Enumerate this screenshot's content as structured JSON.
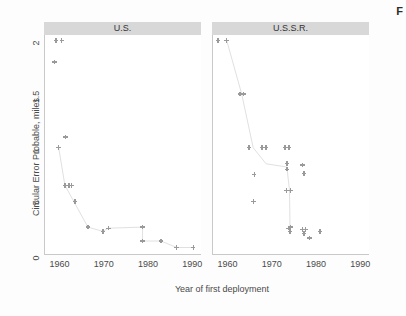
{
  "figure": {
    "corner_glyph": "F",
    "background": "#fdfdfd",
    "marker_color": "#9a9a9a",
    "strip_color": "#d8d8d8",
    "axis_color": "#c9c9c9"
  },
  "chart_data": {
    "type": "scatter",
    "title": "",
    "xlabel": "Year of first deployment",
    "ylabel": "Circular Error Probable, miles",
    "xlim": [
      1956.5,
      1992
    ],
    "ylim": [
      0,
      2.05
    ],
    "xticks": [
      1960,
      1970,
      1980,
      1990
    ],
    "xticklabels": [
      "1960",
      "1970",
      "1980",
      "1990"
    ],
    "yticks": [
      0,
      0.5,
      1,
      1.5,
      2
    ],
    "yticklabels": [
      "0",
      ".5",
      "1",
      "1.5",
      "2"
    ],
    "grid": false,
    "legend": null,
    "facets": [
      {
        "name": "U.S.",
        "label": "U.S.",
        "points": [
          {
            "x": 1959.0,
            "y": 2.0
          },
          {
            "x": 1960.3,
            "y": 2.0
          },
          {
            "x": 1958.6,
            "y": 1.8
          },
          {
            "x": 1959.6,
            "y": 1.0
          },
          {
            "x": 1961.2,
            "y": 1.1
          },
          {
            "x": 1961.0,
            "y": 0.65
          },
          {
            "x": 1961.9,
            "y": 0.65
          },
          {
            "x": 1962.5,
            "y": 0.65
          },
          {
            "x": 1963.3,
            "y": 0.5
          },
          {
            "x": 1966.2,
            "y": 0.26
          },
          {
            "x": 1969.6,
            "y": 0.22
          },
          {
            "x": 1970.8,
            "y": 0.25
          },
          {
            "x": 1978.6,
            "y": 0.26
          },
          {
            "x": 1978.5,
            "y": 0.13
          },
          {
            "x": 1982.7,
            "y": 0.13
          },
          {
            "x": 1986.3,
            "y": 0.07
          },
          {
            "x": 1990.0,
            "y": 0.07
          }
        ],
        "trend": [
          {
            "x": 1959.6,
            "y": 1.0
          },
          {
            "x": 1961.0,
            "y": 0.65
          },
          {
            "x": 1966.2,
            "y": 0.26
          },
          {
            "x": 1969.6,
            "y": 0.22
          },
          {
            "x": 1970.8,
            "y": 0.25
          },
          {
            "x": 1978.6,
            "y": 0.26
          },
          {
            "x": 1978.5,
            "y": 0.13
          },
          {
            "x": 1982.7,
            "y": 0.13
          },
          {
            "x": 1986.3,
            "y": 0.07
          },
          {
            "x": 1990.0,
            "y": 0.07
          }
        ]
      },
      {
        "name": "U.S.S.R.",
        "label": "U.S.S.R.",
        "points": [
          {
            "x": 1957.6,
            "y": 2.0
          },
          {
            "x": 1959.6,
            "y": 2.0
          },
          {
            "x": 1962.6,
            "y": 1.5
          },
          {
            "x": 1963.4,
            "y": 1.5
          },
          {
            "x": 1964.6,
            "y": 1.0
          },
          {
            "x": 1967.6,
            "y": 1.0
          },
          {
            "x": 1968.5,
            "y": 1.0
          },
          {
            "x": 1972.8,
            "y": 1.0
          },
          {
            "x": 1973.7,
            "y": 1.0
          },
          {
            "x": 1965.8,
            "y": 0.75
          },
          {
            "x": 1973.2,
            "y": 0.85
          },
          {
            "x": 1973.2,
            "y": 0.8
          },
          {
            "x": 1976.8,
            "y": 0.84
          },
          {
            "x": 1977.1,
            "y": 0.76
          },
          {
            "x": 1965.7,
            "y": 0.5
          },
          {
            "x": 1973.1,
            "y": 0.6
          },
          {
            "x": 1974.0,
            "y": 0.6
          },
          {
            "x": 1973.6,
            "y": 0.25
          },
          {
            "x": 1974.0,
            "y": 0.26
          },
          {
            "x": 1973.9,
            "y": 0.22
          },
          {
            "x": 1976.8,
            "y": 0.24
          },
          {
            "x": 1977.4,
            "y": 0.24
          },
          {
            "x": 1977.1,
            "y": 0.2
          },
          {
            "x": 1978.3,
            "y": 0.16
          },
          {
            "x": 1980.7,
            "y": 0.22
          }
        ],
        "trend": [
          {
            "x": 1959.6,
            "y": 2.0
          },
          {
            "x": 1963.0,
            "y": 1.5
          },
          {
            "x": 1965.6,
            "y": 1.0
          },
          {
            "x": 1968.5,
            "y": 0.85
          },
          {
            "x": 1973.2,
            "y": 0.82
          },
          {
            "x": 1973.8,
            "y": 0.6
          },
          {
            "x": 1973.9,
            "y": 0.25
          }
        ]
      }
    ]
  }
}
